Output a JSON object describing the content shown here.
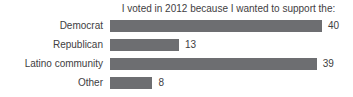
{
  "chart_data": {
    "type": "bar",
    "orientation": "horizontal",
    "title": "I voted in 2012 because I wanted to support the:",
    "categories": [
      "Democrat",
      "Republican",
      "Latino community",
      "Other"
    ],
    "values": [
      40,
      13,
      39,
      8
    ],
    "xlim": [
      0,
      40
    ],
    "value_labels": [
      "40",
      "13",
      "39",
      "8"
    ],
    "bar_color": "#6d6e71",
    "label_color": "#414042",
    "title_color": "#3f4042",
    "background": "#ffffff",
    "grid": "off",
    "legend": "none",
    "axes": "none"
  }
}
